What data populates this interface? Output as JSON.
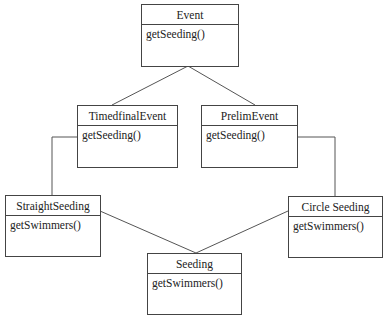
{
  "diagram": {
    "type": "uml-class-diagram",
    "classes": [
      {
        "id": "event",
        "name": "Event",
        "operations": [
          "getSeeding()"
        ]
      },
      {
        "id": "timedfinal",
        "name": "TimedfinalEvent",
        "operations": [
          "getSeeding()"
        ]
      },
      {
        "id": "prelim",
        "name": "PrelimEvent",
        "operations": [
          "getSeeding()"
        ]
      },
      {
        "id": "straight",
        "name": "StraightSeeding",
        "operations": [
          "getSwimmers()"
        ]
      },
      {
        "id": "circle",
        "name": "Circle Seeding",
        "operations": [
          "getSwimmers()"
        ]
      },
      {
        "id": "seeding",
        "name": "Seeding",
        "operations": [
          "getSwimmers()"
        ]
      }
    ],
    "relations": [
      {
        "from": "timedfinal",
        "to": "event"
      },
      {
        "from": "prelim",
        "to": "event"
      },
      {
        "from": "timedfinal",
        "to": "straight"
      },
      {
        "from": "prelim",
        "to": "circle"
      },
      {
        "from": "straight",
        "to": "seeding"
      },
      {
        "from": "circle",
        "to": "seeding"
      }
    ],
    "line_color": "#555555"
  }
}
